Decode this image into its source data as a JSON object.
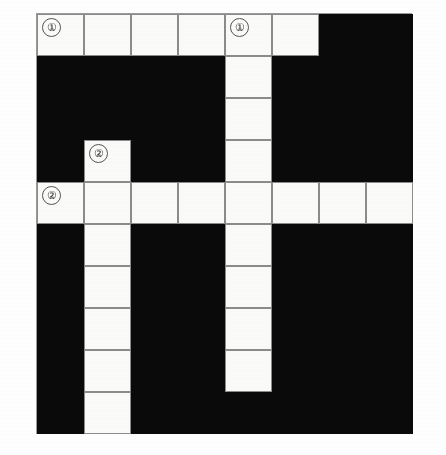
{
  "puzzle": {
    "kind": "crossword-grid",
    "columns": 8,
    "rows": 10,
    "cell_width_px": 47,
    "cell_height_px": 42,
    "colors": {
      "white_cell": "#fbfbf9",
      "black_cell": "#0a0a0a",
      "cell_border": "#8c8c8c",
      "page_background": "#ffffff",
      "clue_number_text": "#222222"
    },
    "legend": {
      "white_cell_meaning": "open letter square",
      "black_cell_meaning": "blocked square"
    },
    "clue_numbers": [
      {
        "label": "①",
        "plain": "1",
        "row": 1,
        "col": 1,
        "direction": "across"
      },
      {
        "label": "①",
        "plain": "1",
        "row": 1,
        "col": 5,
        "direction": "down"
      },
      {
        "label": "②",
        "plain": "2",
        "row": 4,
        "col": 2,
        "direction": "down"
      },
      {
        "label": "②",
        "plain": "2",
        "row": 5,
        "col": 1,
        "direction": "across"
      }
    ],
    "grid_rows": [
      [
        "white",
        "white",
        "white",
        "white",
        "white",
        "white",
        "black",
        "black"
      ],
      [
        "black",
        "black",
        "black",
        "black",
        "white",
        "black",
        "black",
        "black"
      ],
      [
        "black",
        "black",
        "black",
        "black",
        "white",
        "black",
        "black",
        "black"
      ],
      [
        "black",
        "white",
        "black",
        "black",
        "white",
        "black",
        "black",
        "black"
      ],
      [
        "white",
        "white",
        "white",
        "white",
        "white",
        "white",
        "white",
        "white"
      ],
      [
        "black",
        "white",
        "black",
        "black",
        "white",
        "black",
        "black",
        "black"
      ],
      [
        "black",
        "white",
        "black",
        "black",
        "white",
        "black",
        "black",
        "black"
      ],
      [
        "black",
        "white",
        "black",
        "black",
        "white",
        "black",
        "black",
        "black"
      ],
      [
        "black",
        "white",
        "black",
        "black",
        "white",
        "black",
        "black",
        "black"
      ],
      [
        "black",
        "white",
        "black",
        "black",
        "black",
        "black",
        "black",
        "black"
      ]
    ],
    "entries": [
      {
        "number": "①",
        "plain": "1",
        "direction": "across",
        "start_row": 1,
        "start_col": 1,
        "length": 6
      },
      {
        "number": "①",
        "plain": "1",
        "direction": "down",
        "start_row": 1,
        "start_col": 5,
        "length": 9
      },
      {
        "number": "②",
        "plain": "2",
        "direction": "down",
        "start_row": 4,
        "start_col": 2,
        "length": 7
      },
      {
        "number": "②",
        "plain": "2",
        "direction": "across",
        "start_row": 5,
        "start_col": 1,
        "length": 8
      }
    ]
  }
}
